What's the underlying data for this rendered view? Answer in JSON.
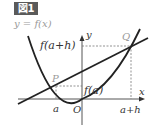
{
  "figure": {
    "badge": "図1",
    "curve_label": "y = f(x)",
    "axis_labels": {
      "x": "x",
      "y": "y",
      "origin": "O"
    },
    "points": {
      "P": "P",
      "Q": "Q"
    },
    "tick_labels": {
      "a": "a",
      "a_plus_h": "a+h",
      "f_a": "f(a)",
      "f_a_plus_h": "f(a+h)"
    },
    "colors": {
      "badge_bg": "#5a5a5a",
      "badge_text": "#ffffff",
      "curve": "#222222",
      "label_gray": "#999999",
      "text": "#333333"
    }
  }
}
